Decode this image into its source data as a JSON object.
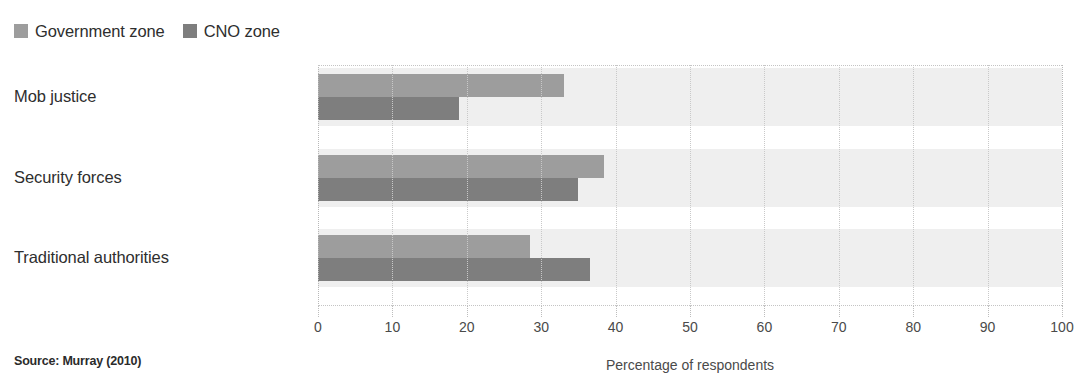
{
  "legend": {
    "items": [
      {
        "label": "Government zone",
        "color": "#9d9d9d",
        "key": "government"
      },
      {
        "label": "CNO zone",
        "color": "#7e7e7e",
        "key": "cno"
      }
    ]
  },
  "source_note": "Source: Murray (2010)",
  "chart_data": {
    "type": "bar",
    "orientation": "horizontal",
    "title": "",
    "subtitle": "",
    "categories": [
      "Mob justice",
      "Security forces",
      "Traditional authorities"
    ],
    "series": [
      {
        "name": "Government zone",
        "color": "#9d9d9d",
        "values": [
          33,
          38.5,
          28.5
        ]
      },
      {
        "name": "CNO zone",
        "color": "#7e7e7e",
        "values": [
          19,
          35,
          36.5
        ]
      }
    ],
    "xlabel": "Percentage of respondents",
    "ylabel": "",
    "xlim": [
      0,
      100
    ],
    "xticks": [
      0,
      10,
      20,
      30,
      40,
      50,
      60,
      70,
      80,
      90,
      100
    ],
    "xtick_labels": [
      "0",
      "10",
      "20",
      "30",
      "40",
      "50",
      "60",
      "70",
      "80",
      "90",
      "100"
    ],
    "grid": "vertical-dotted",
    "legend_position": "top-left",
    "band_color": "#efefef"
  }
}
